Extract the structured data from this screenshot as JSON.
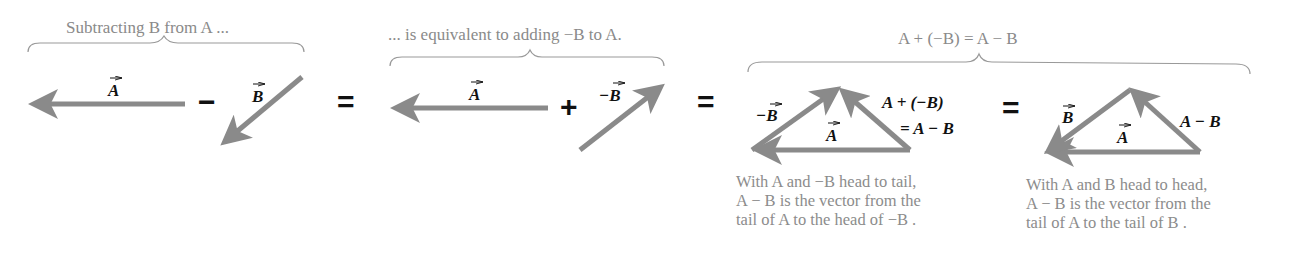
{
  "captions": {
    "subtract": "Subtracting B from A ...",
    "equivalent": "... is equivalent to adding −B to A.",
    "identity": "A + (−B) = A − B"
  },
  "operators": {
    "minus": "−",
    "equals": "=",
    "plus": "+"
  },
  "labels": {
    "A": "A",
    "B": "B",
    "negB": "−B",
    "sum_line1": "A + (−B)",
    "sum_line2": "= A − B",
    "diff": "A − B"
  },
  "descriptions": {
    "head_to_tail": [
      "With A and −B head to tail,",
      "A − B is the vector from the",
      "tail of A to the head of −B ."
    ],
    "head_to_head": [
      "With A and B head to head,",
      "A − B is the vector from the",
      "tail of A to the tail of B ."
    ]
  },
  "colors": {
    "vector": "#8a8a8a",
    "caption": "#8a8a8a",
    "label": "#111111"
  }
}
